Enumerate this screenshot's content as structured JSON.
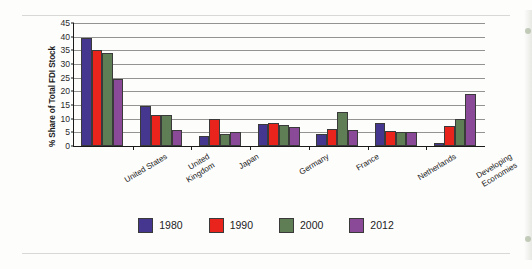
{
  "chart_data": {
    "type": "bar",
    "title": "",
    "subtitle": "",
    "xlabel": "",
    "ylabel": "% Share of Total FDI Stock",
    "ylim": [
      0,
      45
    ],
    "yticks": [
      0,
      5,
      10,
      15,
      20,
      25,
      30,
      35,
      40,
      45
    ],
    "grid": true,
    "legend_position": "bottom",
    "categories": [
      "United States",
      "United Kingdom",
      "Japan",
      "Germany",
      "France",
      "Netherlands",
      "Developing Economies"
    ],
    "series": [
      {
        "name": "1980",
        "color": "#45378f",
        "values": [
          39.5,
          14.7,
          3.5,
          8.2,
          4.5,
          8.5,
          1.0
        ]
      },
      {
        "name": "1990",
        "color": "#e8241c",
        "values": [
          35.0,
          11.5,
          10.0,
          8.5,
          6.2,
          5.5,
          7.5
        ]
      },
      {
        "name": "2000",
        "color": "#5f7e56",
        "values": [
          34.0,
          11.3,
          4.3,
          7.8,
          12.5,
          5.3,
          10.0
        ]
      },
      {
        "name": "2012",
        "color": "#8b4a97",
        "values": [
          24.5,
          6.0,
          5.0,
          6.8,
          6.0,
          5.3,
          19.0
        ]
      }
    ]
  },
  "legend": {
    "items": [
      {
        "label": "1980",
        "color": "#45378f"
      },
      {
        "label": "1990",
        "color": "#e8241c"
      },
      {
        "label": "2000",
        "color": "#5f7e56"
      },
      {
        "label": "2012",
        "color": "#8b4a97"
      }
    ]
  }
}
